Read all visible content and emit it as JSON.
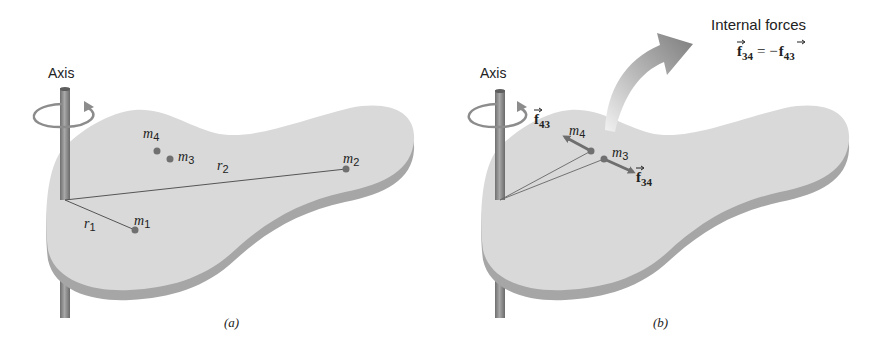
{
  "figure": {
    "panel_a": {
      "caption": "(a)",
      "axis_label": "Axis",
      "masses": [
        {
          "base": "m",
          "sub": "1"
        },
        {
          "base": "m",
          "sub": "2"
        },
        {
          "base": "m",
          "sub": "3"
        },
        {
          "base": "m",
          "sub": "4"
        }
      ],
      "radii": [
        {
          "base": "r",
          "sub": "1"
        },
        {
          "base": "r",
          "sub": "2"
        }
      ]
    },
    "panel_b": {
      "caption": "(b)",
      "axis_label": "Axis",
      "masses": [
        {
          "base": "m",
          "sub": "3"
        },
        {
          "base": "m",
          "sub": "4"
        }
      ],
      "forces": [
        {
          "base": "f",
          "sub": "43"
        },
        {
          "base": "f",
          "sub": "34"
        }
      ],
      "callout": {
        "title": "Internal forces",
        "eq_lhs_base": "f",
        "eq_lhs_sub": "34",
        "eq_op": "= −",
        "eq_rhs_base": "f",
        "eq_rhs_sub": "43"
      }
    },
    "colors": {
      "plate_top": "#d9d9d9",
      "plate_edge": "#a6a6a6",
      "pole": "#8c8c8c",
      "point": "#707070",
      "force_arrow": "#6e6e6e",
      "callout_arrow": "#8a8a8a",
      "text": "#222222"
    }
  }
}
